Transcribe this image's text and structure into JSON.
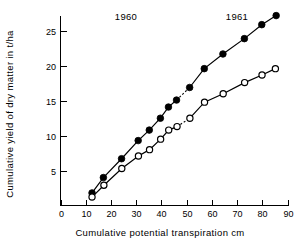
{
  "chart_data": {
    "type": "line",
    "title": "",
    "xlabel": "Cumulative potential transpiration  cm",
    "ylabel": "Cumulative yield of dry matter in t/ha",
    "xlim": [
      0,
      90
    ],
    "ylim": [
      0,
      28
    ],
    "xticks": [
      0,
      10,
      20,
      30,
      40,
      50,
      60,
      70,
      80,
      90
    ],
    "yticks": [
      5,
      10,
      15,
      20,
      25
    ],
    "xtick_labels": [
      "0",
      "10",
      "20",
      "30",
      "40",
      "50",
      "60",
      "70",
      "80",
      "90"
    ],
    "ytick_labels": [
      "5",
      "10",
      "15",
      "20",
      "25"
    ],
    "grid": false,
    "legend": "none",
    "annotations": [
      {
        "text": "1960",
        "x": 30,
        "y": 27.6
      },
      {
        "text": "1961",
        "x": 64,
        "y": 27.6
      }
    ],
    "series": [
      {
        "name": "closed-circles",
        "marker": "filled-circle",
        "points": [
          {
            "x": 12.5,
            "y": 1.8
          },
          {
            "x": 17.0,
            "y": 4.0
          },
          {
            "x": 24.2,
            "y": 6.7
          },
          {
            "x": 30.8,
            "y": 9.3
          },
          {
            "x": 35.2,
            "y": 10.8
          },
          {
            "x": 39.6,
            "y": 12.5
          },
          {
            "x": 42.8,
            "y": 14.1
          },
          {
            "x": 46.0,
            "y": 15.1
          },
          {
            "x": 51.2,
            "y": 16.9
          },
          {
            "x": 57.0,
            "y": 19.6
          },
          {
            "x": 64.4,
            "y": 21.7
          },
          {
            "x": 72.9,
            "y": 23.9
          },
          {
            "x": 79.8,
            "y": 25.9
          },
          {
            "x": 85.5,
            "y": 27.2
          }
        ],
        "gap_between_indices": [
          7,
          8
        ]
      },
      {
        "name": "open-circles",
        "marker": "open-circle",
        "points": [
          {
            "x": 12.5,
            "y": 1.2
          },
          {
            "x": 17.2,
            "y": 2.9
          },
          {
            "x": 24.3,
            "y": 5.3
          },
          {
            "x": 30.9,
            "y": 7.1
          },
          {
            "x": 35.3,
            "y": 8.0
          },
          {
            "x": 39.7,
            "y": 9.5
          },
          {
            "x": 42.9,
            "y": 10.8
          },
          {
            "x": 46.2,
            "y": 11.3
          },
          {
            "x": 51.3,
            "y": 12.5
          },
          {
            "x": 57.1,
            "y": 14.8
          },
          {
            "x": 64.5,
            "y": 16.0
          },
          {
            "x": 73.0,
            "y": 17.6
          },
          {
            "x": 79.9,
            "y": 18.7
          },
          {
            "x": 85.2,
            "y": 19.6
          }
        ],
        "gap_between_indices": [
          7,
          8
        ]
      }
    ]
  },
  "colors": {
    "ink": "#000000",
    "background": "#ffffff"
  }
}
